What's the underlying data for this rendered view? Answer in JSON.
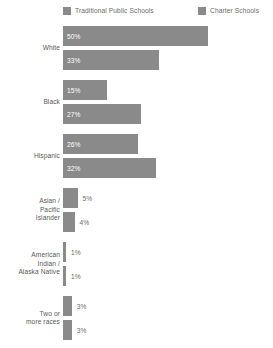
{
  "legend": {
    "items": [
      {
        "label": "Traditional Public Schools",
        "color": "#8a8a8a",
        "icon": "square-swatch-icon"
      },
      {
        "label": "Charter Schools",
        "color": "#8a8a8a",
        "icon": "square-swatch-icon"
      }
    ]
  },
  "chart_data": {
    "type": "bar",
    "orientation": "horizontal",
    "title": "",
    "subtitle": "",
    "xlabel": "",
    "ylabel": "",
    "grid": false,
    "legend_position": "top",
    "xlim": [
      0,
      50
    ],
    "value_suffix": "%",
    "categories": [
      "White",
      "Black",
      "Hispanic",
      "Asian / Pacific Islander",
      "American Indian / Alaska Native",
      "Two or more races"
    ],
    "category_lines": [
      [
        "White"
      ],
      [
        "Black"
      ],
      [
        "Hispanic"
      ],
      [
        "Asian /",
        "Pacific",
        "Islander"
      ],
      [
        "American",
        "Indian /",
        "Alaska Native"
      ],
      [
        "Two or",
        "more races"
      ]
    ],
    "series": [
      {
        "name": "Traditional Public Schools",
        "color": "#8a8a8a",
        "values": [
          50,
          15,
          26,
          5,
          1,
          3
        ],
        "labels": [
          "50%",
          "15%",
          "26%",
          "5%",
          "1%",
          "3%"
        ]
      },
      {
        "name": "Charter Schools",
        "color": "#8a8a8a",
        "values": [
          33,
          27,
          32,
          4,
          1,
          3
        ],
        "labels": [
          "33%",
          "27%",
          "32%",
          "4%",
          "1%",
          "3%"
        ]
      }
    ]
  }
}
